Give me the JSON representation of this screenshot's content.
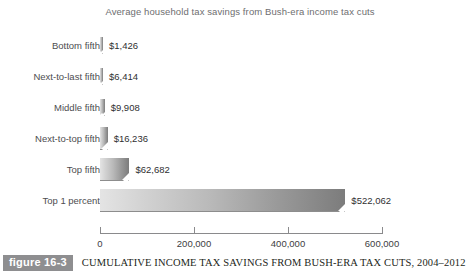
{
  "chart_data": {
    "type": "bar",
    "orientation": "horizontal",
    "title": "Average household tax savings from Bush-era income tax cuts",
    "xlabel": "",
    "ylabel": "",
    "xlim": [
      0,
      600000
    ],
    "grid": false,
    "legend": null,
    "categories": [
      "Bottom fifth",
      "Next-to-last fifth",
      "Middle fifth",
      "Next-to-top fifth",
      "Top fifth",
      "Top 1 percent"
    ],
    "values": [
      1426,
      6414,
      9908,
      16236,
      62682,
      522062
    ],
    "value_labels": [
      "$1,426",
      "$6,414",
      "$9,908",
      "$16,236",
      "$62,682",
      "$522,062"
    ],
    "xticks": [
      0,
      200000,
      400000,
      600000
    ],
    "xtick_labels": [
      "0",
      "200,000",
      "400,000",
      "600,000"
    ],
    "bar_gradient_start": "#e4e4e4",
    "bar_gradient_end": "#7c7c7c"
  },
  "caption": {
    "figure_badge": "figure 16-3",
    "text": "CUMULATIVE INCOME TAX SAVINGS FROM BUSH-ERA TAX CUTS, 2004–2012",
    "badge_bg": "#8e8e90"
  }
}
